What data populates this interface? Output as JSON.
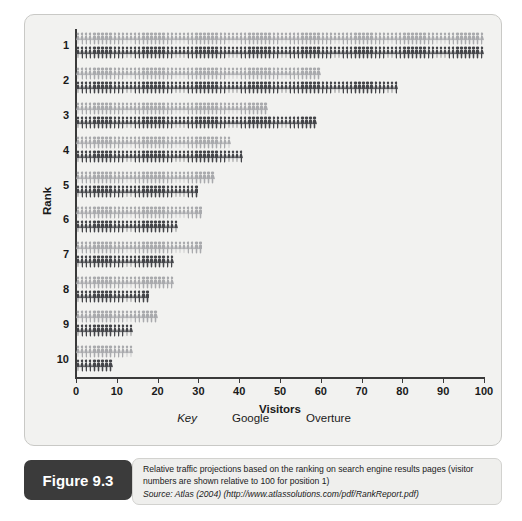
{
  "figure": {
    "tag_label": "Figure 9.3",
    "caption_main": "Relative traffic projections based on the ranking on search engine results pages (visitor numbers are shown relative to 100 for position 1)",
    "caption_source": "Source: Atlas (2004) (http://www.atlassolutions.com/pdf/RankReport.pdf)"
  },
  "legend": {
    "key_label": "Key",
    "entries": [
      {
        "label": "Google",
        "color": "#a9aaad",
        "icon": "person-group-icon"
      },
      {
        "label": "Overture",
        "color": "#444549",
        "icon": "person-group-icon"
      }
    ]
  },
  "chart_data": {
    "type": "bar",
    "title": "",
    "subtitle": "",
    "xlabel": "Visitors",
    "ylabel": "Rank",
    "xlim": [
      0,
      100
    ],
    "xticks": [
      0,
      10,
      20,
      30,
      40,
      50,
      60,
      70,
      80,
      90,
      100
    ],
    "xtick_labels": [
      "0",
      "10",
      "20",
      "30",
      "40",
      "50",
      "60",
      "70",
      "80",
      "90",
      "100"
    ],
    "categories": [
      "1",
      "2",
      "3",
      "4",
      "5",
      "6",
      "7",
      "8",
      "9",
      "10"
    ],
    "orientation": "horizontal",
    "glyph": "person",
    "grid": false,
    "legend_position": "bottom-center",
    "series": [
      {
        "name": "Google",
        "color": "#a9aaad",
        "values": [
          100,
          60,
          47,
          38,
          34,
          31,
          31,
          24,
          20,
          14
        ]
      },
      {
        "name": "Overture",
        "color": "#444549",
        "values": [
          100,
          79,
          59,
          41,
          30,
          25,
          24,
          18,
          14,
          9
        ]
      }
    ]
  }
}
